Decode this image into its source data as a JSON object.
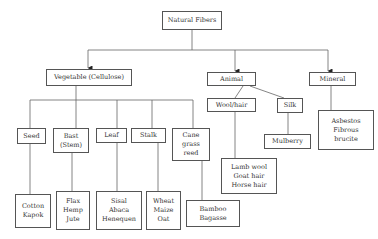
{
  "diagram": {
    "type": "tree",
    "title": "Natural Fibers",
    "colors": {
      "line": "#555555",
      "box_border": "#555555",
      "text": "#333333",
      "background": "#ffffff"
    },
    "root": {
      "label": "Natural Fibers"
    },
    "categories": [
      {
        "label": "Vegetable (Cellulose)",
        "children": [
          {
            "label": "Seed",
            "examples": "Cotton\nKapok"
          },
          {
            "label": "Bast\n(Stem)",
            "examples": "Flax\nHemp\nJute"
          },
          {
            "label": "Leaf",
            "examples": "Sisal\nAbaca\nHenequen"
          },
          {
            "label": "Stalk",
            "examples": "Wheat\nMaize\nOat"
          },
          {
            "label": "Cane\ngrass\nreed",
            "examples": "Bamboo\nBagasse"
          }
        ]
      },
      {
        "label": "Animal",
        "children": [
          {
            "label": "Wool/hair",
            "examples": "Lamb wool\nGoat hair\nHorse hair"
          },
          {
            "label": "Silk",
            "examples": "Mulberry"
          }
        ]
      },
      {
        "label": "Mineral",
        "children": [
          {
            "label": "Asbestos\nFibrous\nbrucite"
          }
        ]
      }
    ]
  }
}
